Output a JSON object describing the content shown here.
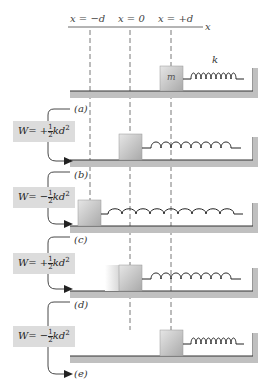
{
  "axis": {
    "label": "x",
    "ticks": [
      {
        "label": "x = −d",
        "x": 90
      },
      {
        "label": "x = 0",
        "x": 130
      },
      {
        "label": "x = +d",
        "x": 171
      }
    ]
  },
  "spring_label": "k",
  "mass_label": "m",
  "panels": [
    {
      "id": "a",
      "label": "(a)",
      "block_position": "+d",
      "spring_state": "compressed"
    },
    {
      "id": "b",
      "label": "(b)",
      "block_position": "0",
      "spring_state": "relaxed"
    },
    {
      "id": "c",
      "label": "(c)",
      "block_position": "−d",
      "spring_state": "stretched"
    },
    {
      "id": "d",
      "label": "(d)",
      "block_position": "0",
      "spring_state": "relaxed"
    },
    {
      "id": "e",
      "label": "(e)",
      "block_position": "+d",
      "spring_state": "compressed"
    }
  ],
  "work_boxes": [
    {
      "sign": "W= +",
      "num": "1",
      "den": "2",
      "tail": "kd",
      "exp": "2"
    },
    {
      "sign": "W= −",
      "num": "1",
      "den": "2",
      "tail": "kd",
      "exp": "2"
    },
    {
      "sign": "W= +",
      "num": "1",
      "den": "2",
      "tail": "kd",
      "exp": "2"
    },
    {
      "sign": "W= −",
      "num": "1",
      "den": "2",
      "tail": "kd",
      "exp": "2"
    }
  ],
  "colors": {
    "box_fill": "#dcdcdc",
    "block_fill": "#c8c8c8",
    "floor": "#bdbdbd",
    "line": "#333333"
  }
}
